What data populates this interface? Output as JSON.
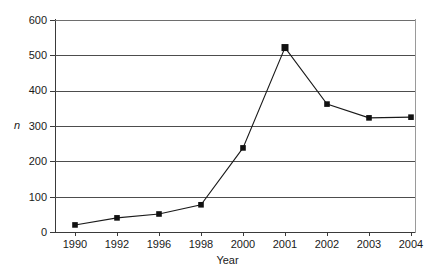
{
  "chart_data": {
    "type": "line",
    "title": "",
    "xlabel": "Year",
    "ylabel": "n",
    "categories": [
      "1990",
      "1992",
      "1996",
      "1998",
      "2000",
      "2001",
      "2002",
      "2003",
      "2004"
    ],
    "values": [
      20,
      40,
      51,
      77,
      238,
      522,
      362,
      323,
      325
    ],
    "series": [
      {
        "name": "n",
        "values": [
          20,
          40,
          51,
          77,
          238,
          522,
          362,
          323,
          325
        ]
      }
    ],
    "ylim": [
      0,
      600
    ],
    "yticks": [
      0,
      100,
      200,
      300,
      400,
      500,
      600
    ],
    "ytick_labels": [
      "0",
      "100",
      "200",
      "300",
      "400",
      "500",
      "600"
    ],
    "grid": "horizontal",
    "legend": "none",
    "marker": "square",
    "line_color": "#1a1a1a",
    "marker_color": "#111111",
    "grid_color": "#4d4d4d",
    "background": "#ffffff"
  }
}
